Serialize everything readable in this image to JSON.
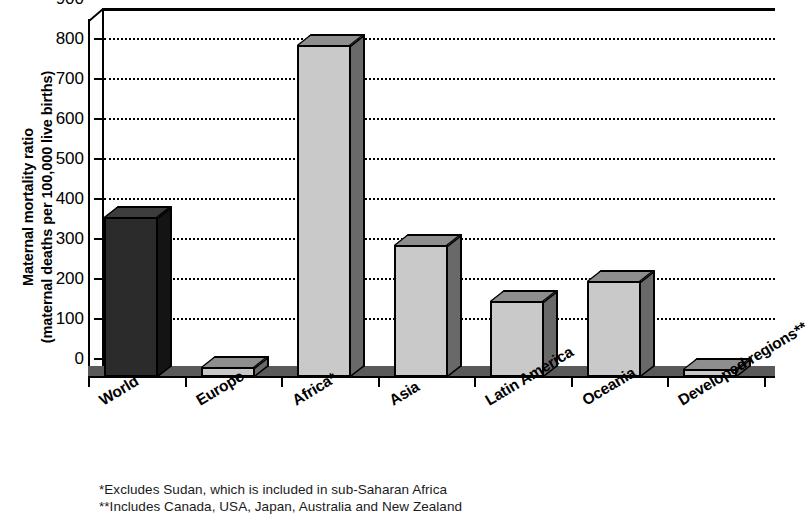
{
  "chart_data": {
    "type": "bar",
    "title": "",
    "subtitle": "",
    "xlabel": "",
    "ylabel": "Maternal mortality ratio\n(maternal deaths per 100,000 live births)",
    "ylabel_line1": "Maternal mortality ratio",
    "ylabel_line2": "(maternal deaths per 100,000 live births)",
    "categories": [
      "World",
      "Europe",
      "Africa*",
      "Asia",
      "Latin America",
      "Oceania",
      "Developed regions**"
    ],
    "values": [
      400,
      24,
      830,
      330,
      190,
      240,
      21
    ],
    "series": [
      {
        "name": "Maternal mortality ratio",
        "values": [
          400,
          24,
          830,
          330,
          190,
          240,
          21
        ]
      }
    ],
    "bar_styles": [
      "dark",
      "light",
      "light",
      "light",
      "light",
      "light",
      "light"
    ],
    "ylim": [
      0,
      900
    ],
    "yticks": [
      0,
      100,
      200,
      300,
      400,
      500,
      600,
      700,
      800,
      900
    ],
    "ytick_labels": [
      "0",
      "100",
      "200",
      "300",
      "400",
      "500",
      "600",
      "700",
      "800",
      "900"
    ],
    "grid": true,
    "grid_style": "dotted-horizontal",
    "legend": null,
    "legend_position": "none",
    "style_3d": true,
    "colors": {
      "bar_light_face": "#c9c9c9",
      "bar_light_side": "#696969",
      "bar_light_top": "#8e8e8e",
      "bar_dark_face": "#2b2b2b",
      "bar_dark_side": "#141414",
      "bar_dark_top": "#3d3d3d",
      "axis": "#000000",
      "grid": "#000000",
      "background": "#ffffff",
      "floor": "#5a5a5a"
    },
    "annotations": [
      "*Excludes Sudan, which is included in sub-Saharan Africa",
      "**Includes Canada, USA, Japan, Australia and New Zealand"
    ]
  },
  "footnotes": {
    "line1": "*Excludes Sudan, which is included in sub-Saharan Africa",
    "line2": "**Includes Canada, USA, Japan, Australia and New Zealand"
  }
}
